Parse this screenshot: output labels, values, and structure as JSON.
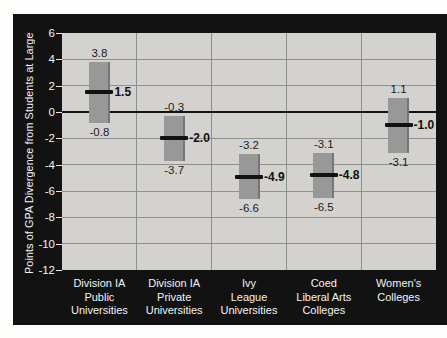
{
  "chart": {
    "y_axis_title": "Points of GPA Divergence from Students at Large"
  },
  "chart_data": {
    "type": "bar",
    "subtype": "floating-range-bars-with-mean-markers",
    "title": "",
    "xlabel": "",
    "ylabel": "Points of GPA Divergence from Students at Large",
    "ylim": [
      -12,
      6
    ],
    "ytick_step": 2,
    "yticks": [
      6,
      4,
      2,
      0,
      -2,
      -4,
      -6,
      -8,
      -10,
      -12
    ],
    "ytick_labels": [
      "6",
      "4",
      "2",
      "0",
      "-2",
      "-4",
      "-6",
      "-8",
      "-10",
      "-12"
    ],
    "grid": true,
    "zero_baseline": true,
    "legend": "none",
    "categories": [
      "Division IA\nPublic\nUniversities",
      "Division IA\nPrivate\nUniversities",
      "Ivy\nLeague\nUniversities",
      "Coed\nLiberal Arts\nColleges",
      "Women's\nColleges"
    ],
    "series": [
      {
        "category": "Division IA Public Universities",
        "high": 3.8,
        "low": -0.8,
        "mean": 1.5,
        "high_label": "3.8",
        "low_label": "-0.8",
        "mean_label": "1.5"
      },
      {
        "category": "Division IA Private Universities",
        "high": -0.3,
        "low": -3.7,
        "mean": -2.0,
        "high_label": "-0.3",
        "low_label": "-3.7",
        "mean_label": "-2.0"
      },
      {
        "category": "Ivy League Universities",
        "high": -3.2,
        "low": -6.6,
        "mean": -4.9,
        "high_label": "-3.2",
        "low_label": "-6.6",
        "mean_label": "-4.9"
      },
      {
        "category": "Coed Liberal Arts Colleges",
        "high": -3.1,
        "low": -6.5,
        "mean": -4.8,
        "high_label": "-3.1",
        "low_label": "-6.5",
        "mean_label": "-4.8"
      },
      {
        "category": "Women's Colleges",
        "high": 1.1,
        "low": -3.1,
        "mean": -1.0,
        "high_label": "1.1",
        "low_label": "-3.1",
        "mean_label": "-1.0"
      }
    ],
    "colors": {
      "page_bg": "#fdfdfc",
      "frame_bg": "#121212",
      "plot_bg": "#d3d2cf",
      "bar": "#989898",
      "bar_edge": "#767676",
      "grid_line": "#8f8f8f",
      "zero_line": "#121212",
      "mean_marker": "#121212",
      "plot_text": "#1c1c1c",
      "frame_text": "#f2f2f2"
    }
  }
}
